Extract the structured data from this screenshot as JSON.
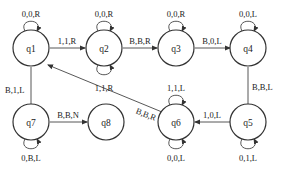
{
  "diagram": {
    "type": "turing-machine-state-diagram",
    "states": [
      {
        "id": "q1",
        "label": "q1"
      },
      {
        "id": "q2",
        "label": "q2"
      },
      {
        "id": "q3",
        "label": "q3"
      },
      {
        "id": "q4",
        "label": "q4"
      },
      {
        "id": "q5",
        "label": "q5"
      },
      {
        "id": "q6",
        "label": "q6"
      },
      {
        "id": "q7",
        "label": "q7"
      },
      {
        "id": "q8",
        "label": "q8"
      }
    ],
    "transitions": [
      {
        "from": "q1",
        "to": "q1",
        "label": "0,0,R"
      },
      {
        "from": "q1",
        "to": "q2",
        "label": "1,1,R"
      },
      {
        "from": "q2",
        "to": "q2",
        "label": "0,0,R"
      },
      {
        "from": "q2",
        "to": "q2",
        "label": "1,1,R"
      },
      {
        "from": "q2",
        "to": "q3",
        "label": "B,B,R"
      },
      {
        "from": "q3",
        "to": "q3",
        "label": "0,0,R"
      },
      {
        "from": "q3",
        "to": "q4",
        "label": "B,0,L"
      },
      {
        "from": "q4",
        "to": "q4",
        "label": "0,0,L"
      },
      {
        "from": "q4",
        "to": "q5",
        "label": "B,B,L"
      },
      {
        "from": "q5",
        "to": "q5",
        "label": "0,1,L"
      },
      {
        "from": "q5",
        "to": "q6",
        "label": "1,0,L"
      },
      {
        "from": "q6",
        "to": "q6",
        "label": "1,1,L"
      },
      {
        "from": "q6",
        "to": "q6",
        "label": "0,0,L"
      },
      {
        "from": "q6",
        "to": "q1",
        "label": "B,B,R"
      },
      {
        "from": "q1",
        "to": "q7",
        "label": "B,1,L"
      },
      {
        "from": "q7",
        "to": "q7",
        "label": "0,B,L"
      },
      {
        "from": "q7",
        "to": "q8",
        "label": "B,B,N"
      }
    ]
  }
}
